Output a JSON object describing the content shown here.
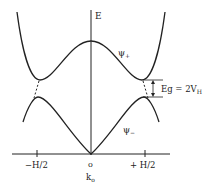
{
  "diagram": {
    "axis_labels": {
      "y": "E",
      "origin": "o",
      "x_center": "k",
      "x_center_sub": "o"
    },
    "ticks": {
      "left": "−H/2",
      "right": "+ H/2"
    },
    "bands": {
      "upper": "ψ",
      "upper_sub": "+",
      "lower": "ψ",
      "lower_sub": "−"
    },
    "gap": {
      "label": "Eg = 2V",
      "label_sub": "H"
    },
    "colors": {
      "line": "#222222",
      "background": "#ffffff"
    }
  }
}
